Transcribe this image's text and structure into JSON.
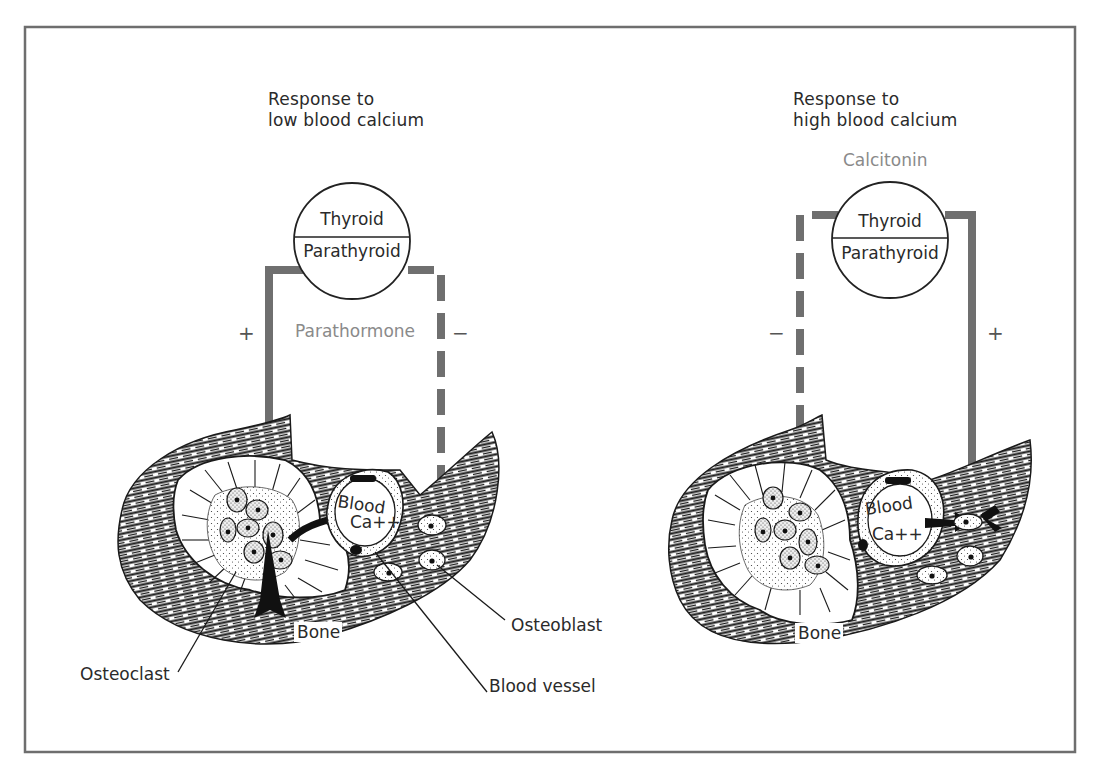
{
  "figure": {
    "frame_color": "#6e6e6e",
    "pathway_color": "#6f6f6f",
    "hormone_text_color": "#8a8a8a",
    "ink_color": "#1a1a1a"
  },
  "left_panel": {
    "title_line1": "Response to",
    "title_line2": "low blood calcium",
    "gland_top": "Thyroid",
    "gland_bottom": "Parathyroid",
    "hormone": "Parathormone",
    "sign_left": "+",
    "sign_right": "−",
    "blood_label_line1": "Blood",
    "blood_label_line2": "Ca++",
    "bone_label": "Bone",
    "callouts": {
      "osteoclast": "Osteoclast",
      "osteoblast": "Osteoblast",
      "blood_vessel": "Blood vessel"
    }
  },
  "right_panel": {
    "title_line1": "Response to",
    "title_line2": "high blood calcium",
    "gland_top": "Thyroid",
    "gland_bottom": "Parathyroid",
    "hormone": "Calcitonin",
    "sign_left": "−",
    "sign_right": "+",
    "blood_label_line1": "Blood",
    "blood_label_line2": "Ca++",
    "bone_label": "Bone"
  }
}
